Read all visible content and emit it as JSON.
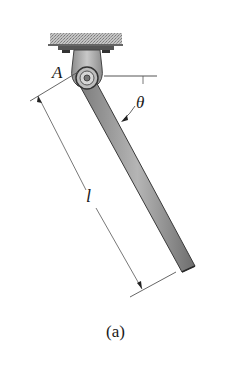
{
  "figure": {
    "caption": "(a)",
    "labels": {
      "pin": "A",
      "angle": "θ",
      "length": "l"
    },
    "colors": {
      "rod_fill": "#9a9a9a",
      "rod_edge": "#3a3a3a",
      "support_fill": "#b0b0b0",
      "ceiling_hatch": "#a8a8a8",
      "line": "#555555",
      "text": "#1a1a1a"
    }
  }
}
